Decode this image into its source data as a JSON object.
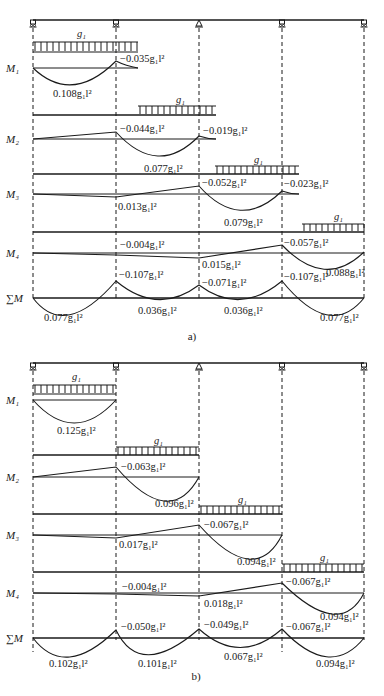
{
  "figure": {
    "supports_x": [
      33,
      116,
      199,
      282,
      364
    ],
    "support_types": [
      "roller",
      "roller",
      "pin",
      "roller",
      "roller"
    ],
    "load_label": "g₁"
  },
  "part_a": {
    "caption": "a)",
    "rows": [
      {
        "name": "M₁",
        "labels": [
          "−0.035g₁l²",
          "0.108g₁l²"
        ]
      },
      {
        "name": "M₂",
        "labels": [
          "−0.044g₁l²",
          "−0.019g₁l²",
          "0.077g₁l²"
        ]
      },
      {
        "name": "M₃",
        "labels": [
          "−0.052g₁l²",
          "−0.023g₁l²",
          "0.013g₁l²",
          "0.079g₁l²"
        ]
      },
      {
        "name": "M₄",
        "labels": [
          "−0.004g₁l²",
          "−0.057g₁l²",
          "0.015g₁l²",
          "0.088g₁l²"
        ]
      },
      {
        "name": "∑M",
        "labels": [
          "−0.107g₁l²",
          "−0.071g₁l²",
          "−0.107g₁l²",
          "0.077g₁l²",
          "0.036g₁l²",
          "0.036g₁l²",
          "0.077g₁l²"
        ]
      }
    ]
  },
  "part_b": {
    "caption": "b)",
    "rows": [
      {
        "name": "M₁",
        "labels": [
          "0.125g₁l²"
        ]
      },
      {
        "name": "M₂",
        "labels": [
          "−0.063g₁l²",
          "0.096g₁l²"
        ]
      },
      {
        "name": "M₃",
        "labels": [
          "−0.067g₁l²",
          "0.017g₁l²",
          "0.094g₁l²"
        ]
      },
      {
        "name": "M₄",
        "labels": [
          "−0.004g₁l²",
          "−0.067g₁l²",
          "0.018g₁l²",
          "0.094g₁l²"
        ]
      },
      {
        "name": "∑M",
        "labels": [
          "−0.050g₁l²",
          "−0.049g₁l²",
          "−0.067g₁l²",
          "0.102g₁l²",
          "0.101g₁l²",
          "0.067g₁l²",
          "0.094g₁l²"
        ]
      }
    ]
  }
}
